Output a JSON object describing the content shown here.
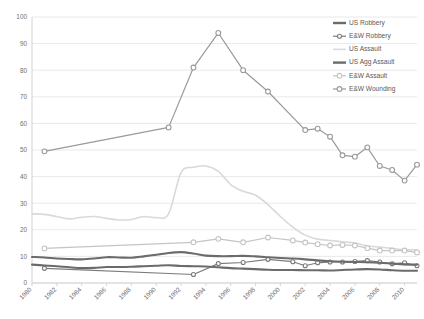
{
  "chart_data": {
    "type": "line",
    "title": "",
    "xlabel": "",
    "ylabel": "",
    "xlim": [
      1980,
      2011
    ],
    "ylim": [
      0,
      100
    ],
    "ytick_step": 10,
    "xtick_step": 2,
    "grid": true,
    "legend_position": "top-right",
    "yticks": [
      0,
      10,
      20,
      30,
      40,
      50,
      60,
      70,
      80,
      90,
      100
    ],
    "xticks": [
      1980,
      1982,
      1984,
      1986,
      1988,
      1990,
      1992,
      1994,
      1996,
      1998,
      2000,
      2002,
      2004,
      2006,
      2008,
      2010
    ],
    "series": [
      {
        "name": "US Robbery",
        "color": "#6b6b6b",
        "style": "thick-line",
        "marker": "none",
        "x": [
          1980,
          1981,
          1982,
          1983,
          1984,
          1985,
          1986,
          1987,
          1988,
          1989,
          1990,
          1991,
          1992,
          1993,
          1994,
          1995,
          1996,
          1997,
          1998,
          1999,
          2000,
          2001,
          2002,
          2003,
          2004,
          2005,
          2006,
          2007,
          2008,
          2009,
          2010,
          2011
        ],
        "values": [
          6.9,
          6.6,
          6.3,
          5.9,
          5.6,
          5.7,
          6.0,
          6.0,
          6.1,
          6.3,
          6.5,
          6.7,
          6.4,
          6.3,
          6.2,
          5.9,
          5.6,
          5.4,
          5.2,
          5.0,
          4.9,
          4.9,
          4.8,
          4.8,
          4.7,
          4.9,
          5.1,
          5.2,
          5.1,
          4.8,
          4.6,
          4.6
        ]
      },
      {
        "name": "E&W Robbery",
        "color": "#7b7b7b",
        "style": "line-marker",
        "marker": "circle-small",
        "x": [
          1981,
          1993,
          1995,
          1997,
          1999,
          2001,
          2002,
          2003,
          2004,
          2005,
          2006,
          2007,
          2008,
          2009,
          2010,
          2011
        ],
        "values": [
          5.5,
          3.2,
          7.3,
          7.7,
          8.9,
          8.0,
          6.5,
          7.6,
          7.9,
          7.9,
          8.1,
          8.4,
          7.9,
          7.2,
          7.6,
          6.5
        ]
      },
      {
        "name": "US Assault",
        "color": "#d9d9d9",
        "style": "thin-line",
        "marker": "none",
        "x": [
          1980,
          1981,
          1982,
          1983,
          1984,
          1985,
          1986,
          1987,
          1988,
          1989,
          1990,
          1991,
          1992,
          1993,
          1994,
          1995,
          1996,
          1997,
          1998,
          1999,
          2000,
          2001,
          2002,
          2003,
          2004,
          2005,
          2006,
          2007,
          2008,
          2009,
          2010,
          2011
        ],
        "values": [
          26.0,
          25.8,
          25.0,
          24.1,
          24.7,
          25.0,
          24.3,
          23.7,
          23.9,
          25.0,
          24.6,
          26.0,
          41.5,
          43.5,
          44.0,
          42.0,
          37.0,
          34.5,
          33.0,
          29.5,
          25.0,
          21.0,
          18.0,
          16.5,
          16.0,
          15.5,
          15.0,
          14.0,
          13.5,
          13.0,
          12.5,
          12.5
        ]
      },
      {
        "name": "US Agg Assault",
        "color": "#6b6b6b",
        "style": "thick-line",
        "marker": "none",
        "x": [
          1980,
          1981,
          1982,
          1983,
          1984,
          1985,
          1986,
          1987,
          1988,
          1989,
          1990,
          1991,
          1992,
          1993,
          1994,
          1995,
          1996,
          1997,
          1998,
          1999,
          2000,
          2001,
          2002,
          2003,
          2004,
          2005,
          2006,
          2007,
          2008,
          2009,
          2010,
          2011
        ],
        "values": [
          9.8,
          9.6,
          9.2,
          9.0,
          8.9,
          9.2,
          9.7,
          9.6,
          9.5,
          10.0,
          10.6,
          11.3,
          11.6,
          11.1,
          10.3,
          10.1,
          10.1,
          10.2,
          10.0,
          9.7,
          9.4,
          9.2,
          8.9,
          8.5,
          8.2,
          8.0,
          7.9,
          7.8,
          7.6,
          7.3,
          7.0,
          6.9
        ]
      },
      {
        "name": "E&W Assault",
        "color": "#c4c4c4",
        "style": "line-marker",
        "marker": "circle",
        "x": [
          1981,
          1993,
          1995,
          1997,
          1999,
          2001,
          2002,
          2003,
          2004,
          2005,
          2006,
          2007,
          2008,
          2009,
          2010,
          2011
        ],
        "values": [
          13.0,
          15.3,
          16.6,
          15.3,
          17.1,
          16.0,
          15.2,
          14.6,
          14.1,
          14.3,
          14.1,
          13.1,
          12.2,
          12.2,
          12.2,
          11.5
        ]
      },
      {
        "name": "E&W Wounding",
        "color": "#9a9a9a",
        "style": "line-marker",
        "marker": "circle",
        "x": [
          1981,
          1991,
          1993,
          1995,
          1997,
          1999,
          2002,
          2003,
          2004,
          2005,
          2006,
          2007,
          2008,
          2009,
          2010,
          2011
        ],
        "values": [
          49.5,
          58.5,
          81.0,
          94.0,
          80.0,
          72.0,
          57.5,
          58.0,
          55.0,
          48.0,
          47.5,
          51.0,
          44.0,
          42.5,
          38.5,
          44.5
        ]
      }
    ],
    "scatter_only_points": [
      {
        "series": "E&W Wounding",
        "x": 1981,
        "y": 49.5
      },
      {
        "series": "E&W Wounding",
        "x": 1991,
        "y": 58.5
      },
      {
        "series": "E&W Wounding",
        "x": 1993,
        "y": 81.0
      },
      {
        "series": "E&W Wounding",
        "x": 1995,
        "y": 94.0
      },
      {
        "series": "E&W Wounding",
        "x": 1997,
        "y": 80.0
      },
      {
        "series": "E&W Wounding",
        "x": 1999,
        "y": 72.0
      }
    ]
  },
  "legend": {
    "items": [
      {
        "label": "US Robbery",
        "color": "#6b6b6b",
        "marker": "none",
        "style": "thick-line"
      },
      {
        "label": "E&W Robbery",
        "color": "#7b7b7b",
        "marker": "circle-small",
        "style": "line-marker"
      },
      {
        "label": "US Assault",
        "color": "#d9d9d9",
        "marker": "none",
        "style": "thin-line"
      },
      {
        "label": "US Agg Assault",
        "color": "#6b6b6b",
        "marker": "none",
        "style": "thick-line"
      },
      {
        "label": "E&W Assault",
        "color": "#c4c4c4",
        "marker": "circle",
        "style": "line-marker"
      },
      {
        "label": "E&W Wounding",
        "color": "#9a9a9a",
        "marker": "circle",
        "style": "line-marker"
      }
    ]
  },
  "colors": {
    "grid": "#e6e6e6",
    "axis": "#d2d2d2",
    "tick_text": "#6f6f6f",
    "background": "#ffffff"
  }
}
